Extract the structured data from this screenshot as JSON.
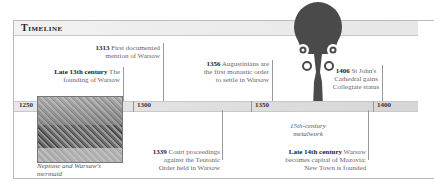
{
  "title": "Timeline",
  "axis": {
    "ticks": [
      "1250",
      "1300",
      "1350",
      "1400"
    ]
  },
  "events_top": [
    {
      "year": "1313",
      "text": " First documented mention of Warsaw",
      "line1_bold": "1313",
      "line1": " First documented",
      "line2": "mention of Warsaw"
    },
    {
      "year": "Late 13th century",
      "line1_bold": "Late 13th century",
      "line1": " The",
      "line2": "founding of Warsaw"
    },
    {
      "year": "1356",
      "line1_bold": "1356",
      "line1": " Augustinians are",
      "line2": "the first monastic order",
      "line3": "to settle in Warsaw"
    },
    {
      "year": "1406",
      "line1_bold": "1406",
      "line1": " St John's",
      "line2": "Cathedral gains",
      "line3": "Collegiate status"
    }
  ],
  "events_bottom": [
    {
      "year": "1339",
      "line1_bold": "1339",
      "line1": " Court proceedings",
      "line2": "against the Teutonic",
      "line3": "Order held in Warsaw"
    },
    {
      "year": "Late 14th century",
      "line1_bold": "Late 14th century",
      "line1": " Warsaw",
      "line2": "becomes capital of Mazovia;",
      "line3": "New Town is founded"
    }
  ],
  "images": [
    {
      "name": "neptune-mermaid-engraving",
      "caption_line1": "Neptune and Warsaw's",
      "caption_line2": "mermaid"
    },
    {
      "name": "15th-century-metalwork",
      "caption_line1": "15th-century",
      "caption_line2": "metalwork"
    }
  ],
  "colors": {
    "text": "#666666",
    "bold": "#222222",
    "bar": "#e0e0e0",
    "rule": "#999999"
  }
}
